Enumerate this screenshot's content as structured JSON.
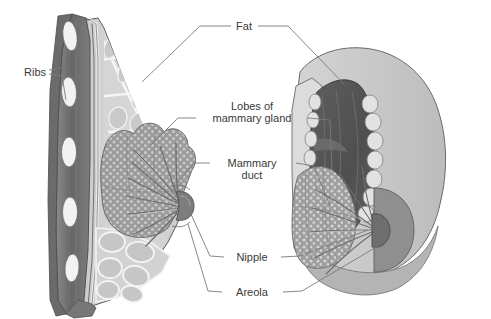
{
  "figure": {
    "background_color": "#ffffff",
    "width": 491,
    "height": 319
  },
  "labels": [
    {
      "id": "ribs",
      "text": "Ribs",
      "text2": "",
      "x": 24,
      "y": 72,
      "anchor": "start"
    },
    {
      "id": "fat",
      "text": "Fat",
      "text2": "",
      "x": 244,
      "y": 29,
      "anchor": "middle"
    },
    {
      "id": "lobes",
      "text": "Lobes of",
      "text2": "mammary gland",
      "x": 252,
      "y": 118,
      "anchor": "middle"
    },
    {
      "id": "duct",
      "text": "Mammary",
      "text2": "duct",
      "x": 252,
      "y": 166,
      "anchor": "middle"
    },
    {
      "id": "nipple",
      "text": "Nipple",
      "text2": "",
      "x": 252,
      "y": 260,
      "anchor": "middle"
    },
    {
      "id": "areola",
      "text": "Areola",
      "text2": "",
      "x": 252,
      "y": 295,
      "anchor": "middle"
    }
  ],
  "colors": {
    "text": "#3a3a3a",
    "leader_line": "#7a7a7a",
    "outline": "#4a4a4a",
    "muscle_dark": "#6e6e6e",
    "muscle_mid": "#868686",
    "rib_white": "#f2f2f2",
    "fat_light": "#d8d8d8",
    "fat_mid": "#c4c4c4",
    "septa_white": "#f4f4f4",
    "gland_gray": "#9a9a9a",
    "gland_stipple": "#c9c9c9",
    "duct_gray": "#8c8c8c",
    "nipple_dark": "#707070",
    "areola_gray": "#8f8f8f",
    "skin_light": "#cfcfcf",
    "skin_mid": "#bdbdbd",
    "cutaway_dark": "#585858"
  },
  "structures": {
    "left_view": "sagittal cross-section showing ribs, pectoral muscle, fat lobules, mammary gland lobes, ducts, nipple",
    "right_view": "anterior oblique view with wedge cutaway showing glandular tissue, ducts, nipple and areola"
  }
}
